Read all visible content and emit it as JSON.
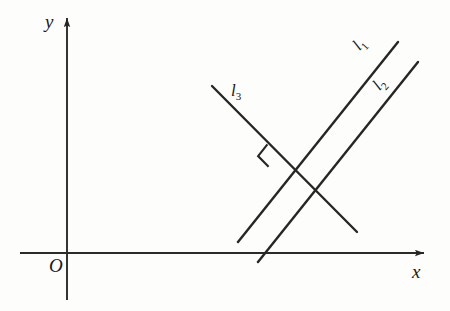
{
  "figure": {
    "background_color": "#fdfdfc",
    "ink_color": "#262626",
    "axes": {
      "origin_label": "O",
      "x_axis_label": "x",
      "y_axis_label": "y",
      "origin_px": [
        67,
        253
      ],
      "x_axis_from_px": [
        20,
        253
      ],
      "x_axis_to_px": [
        429,
        253
      ],
      "y_axis_from_px": [
        67,
        300
      ],
      "y_axis_to_px": [
        67,
        13
      ],
      "x_arrow": "right-arrowhead",
      "y_arrow": "up-arrowhead"
    },
    "lines": [
      {
        "id": "l1",
        "label": "l",
        "subscript": "1",
        "from_px": [
          238,
          242
        ],
        "to_px": [
          398,
          42
        ],
        "label_rotation_deg": -48,
        "relation": "parallel to l2, perpendicular to l3"
      },
      {
        "id": "l2",
        "label": "l",
        "subscript": "2",
        "from_px": [
          258,
          262
        ],
        "to_px": [
          418,
          62
        ],
        "label_rotation_deg": -48,
        "relation": "parallel to l1"
      },
      {
        "id": "l3",
        "label": "l",
        "subscript": "3",
        "from_px": [
          212,
          86
        ],
        "to_px": [
          357,
          232
        ],
        "label_rotation_deg": 0,
        "relation": "perpendicular to l1"
      }
    ],
    "right_angle_marker": {
      "name": "right-angle-square",
      "at_intersection_of": [
        "l1",
        "l3"
      ],
      "vertex_px": [
        278,
        155
      ],
      "size_px": 15
    }
  }
}
